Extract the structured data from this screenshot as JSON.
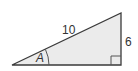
{
  "diagram": {
    "type": "right-triangle",
    "colors": {
      "fill": "#ebebeb",
      "stroke": "#3a3a3a",
      "label": "#333333"
    },
    "vertices": {
      "left": [
        12,
        65
      ],
      "top_right": [
        121,
        13
      ],
      "bottom_right": [
        121,
        65
      ]
    },
    "labels": {
      "hypotenuse": "10",
      "opposite_side": "6",
      "angle": "A"
    },
    "right_angle_marker": true
  }
}
